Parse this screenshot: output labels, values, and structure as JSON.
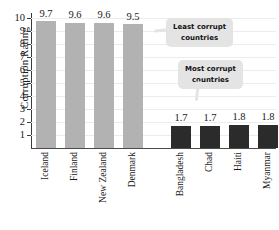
{
  "chart_data": {
    "type": "bar",
    "title": "",
    "xlabel": "",
    "ylabel": "Corruption Rating",
    "ylim": [
      0,
      10
    ],
    "grid": true,
    "legend": "none",
    "categories": [
      "Iceland",
      "Finland",
      "New Zealand",
      "Denmark",
      "Bangladesh",
      "Chad",
      "Haiti",
      "Myanmar"
    ],
    "values": [
      9.7,
      9.6,
      9.6,
      9.5,
      1.7,
      1.7,
      1.8,
      1.8
    ],
    "value_labels": [
      "9.7",
      "9.6",
      "9.6",
      "9.5",
      "1.7",
      "1.7",
      "1.8",
      "1.8"
    ],
    "bar_colors": [
      "#b2b2b2",
      "#b2b2b2",
      "#b2b2b2",
      "#b2b2b2",
      "#2b2b2b",
      "#2b2b2b",
      "#2b2b2b",
      "#2b2b2b"
    ],
    "ytick_labels": [
      "10",
      "9",
      "8",
      "7",
      "6",
      "5",
      "4",
      "3",
      "2",
      "1"
    ],
    "ytick_values": [
      10,
      9,
      8,
      7,
      6,
      5,
      4,
      3,
      2,
      1
    ],
    "annotations": [
      {
        "text_line1": "Least corrupt",
        "text_line2": "countries",
        "points_to": "Denmark"
      },
      {
        "text_line1": "Most corrupt",
        "text_line2": "countries",
        "points_to": "Bangladesh"
      }
    ]
  },
  "colors": {
    "light_bar": "#b2b2b2",
    "dark_bar": "#2b2b2b",
    "callout_bg": "#e4e4e4",
    "axis": "#3a3a3a",
    "gridline": "#ececec"
  }
}
